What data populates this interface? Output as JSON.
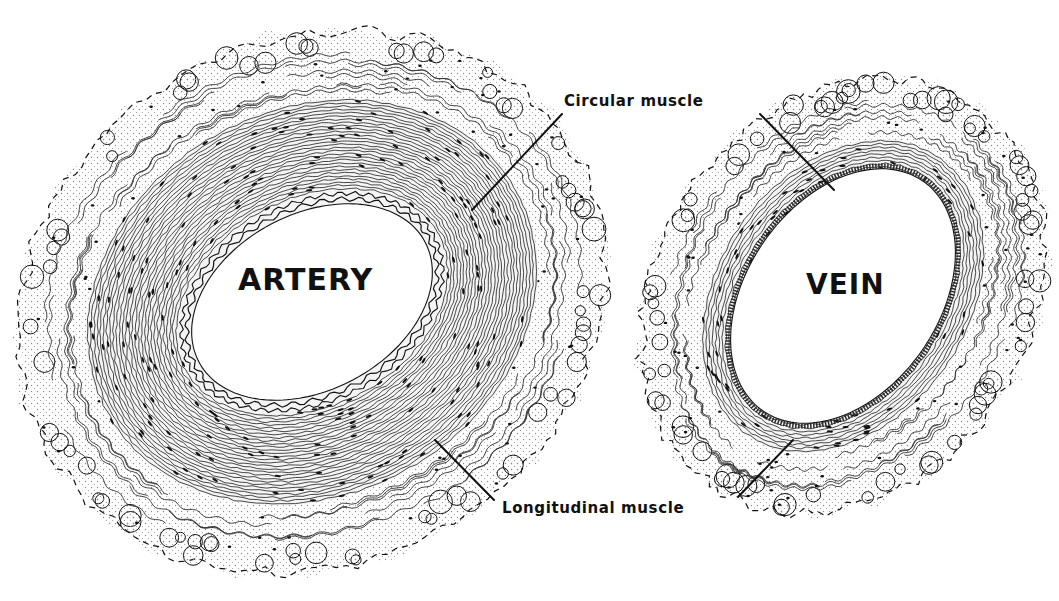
{
  "figure": {
    "colors": {
      "background": "#ffffff",
      "ink": "#111111",
      "stipple": "#8a8a8a"
    }
  },
  "vessels": [
    {
      "id": "artery",
      "label": "ARTERY",
      "center": [
        312,
        302
      ],
      "rotation_deg": -28,
      "lumen_radii": [
        128,
        88
      ],
      "elastic_lamina_width": 14,
      "media_width": 92,
      "adventitia_width": 70,
      "label_pos": [
        238,
        262
      ],
      "label_size": 30
    },
    {
      "id": "vein",
      "label": "VEIN",
      "center": [
        843,
        296
      ],
      "rotation_deg": -55,
      "lumen_radii": [
        140,
        96
      ],
      "elastic_lamina_width": 0,
      "media_width": 30,
      "adventitia_width": 62,
      "label_pos": [
        806,
        268
      ],
      "label_size": 28
    }
  ],
  "callouts": [
    {
      "id": "circular-muscle",
      "text": "Circular muscle",
      "label_pos": [
        562,
        92
      ],
      "leaders": [
        {
          "from": [
            562,
            114
          ],
          "to": [
            472,
            210
          ]
        },
        {
          "from": [
            760,
            114
          ],
          "to": [
            834,
            190
          ]
        }
      ]
    },
    {
      "id": "longitudinal-muscle",
      "text": "Longitudinal muscle",
      "label_pos": [
        500,
        499
      ],
      "leaders": [
        {
          "from": [
            494,
            500
          ],
          "to": [
            435,
            440
          ]
        },
        {
          "from": [
            738,
            497
          ],
          "to": [
            793,
            440
          ]
        }
      ]
    }
  ]
}
